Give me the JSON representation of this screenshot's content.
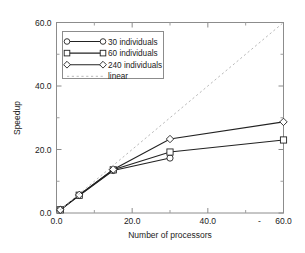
{
  "chart_data": {
    "type": "line",
    "title": "",
    "xlabel": "Number of processors",
    "ylabel": "Speedup",
    "xlim": [
      0,
      60
    ],
    "ylim": [
      0,
      60
    ],
    "grid": false,
    "legend_position": "upper-left-inside",
    "x_ticks": [
      "0.0",
      "20.0",
      "40.0",
      "60.0"
    ],
    "x_tick_values": [
      0,
      20,
      40,
      60
    ],
    "x_minor_ticks": [
      10,
      30,
      50
    ],
    "y_ticks": [
      "0.0",
      "20.0",
      "40.0",
      "60.0"
    ],
    "y_tick_values": [
      0,
      20,
      40,
      60
    ],
    "y_minor_ticks": [
      10,
      30,
      50
    ],
    "series": [
      {
        "name": "30 individuals",
        "marker": "circle",
        "line_style": "solid",
        "color": "#222222",
        "x": [
          1,
          6,
          15,
          30
        ],
        "values": [
          1.0,
          5.5,
          13.4,
          17.3
        ]
      },
      {
        "name": "60 individuals",
        "marker": "square",
        "line_style": "solid",
        "color": "#222222",
        "x": [
          1,
          6,
          15,
          30,
          60
        ],
        "values": [
          1.0,
          5.6,
          13.6,
          19.2,
          23.0
        ]
      },
      {
        "name": "240 individuals",
        "marker": "diamond",
        "line_style": "solid",
        "color": "#222222",
        "x": [
          1,
          6,
          15,
          30,
          60
        ],
        "values": [
          1.0,
          5.7,
          13.7,
          23.3,
          28.7
        ]
      },
      {
        "name": "linear",
        "marker": "none",
        "line_style": "dashed",
        "color": "#b9b9b9",
        "x": [
          0,
          60
        ],
        "values": [
          0,
          60
        ]
      }
    ]
  },
  "legend": {
    "entries": [
      {
        "label": "30 individuals"
      },
      {
        "label": "60 individuals"
      },
      {
        "label": "240 individuals"
      },
      {
        "label": "linear"
      }
    ]
  },
  "axes": {
    "x_title": "Number of processors",
    "y_title": "Speedup",
    "x_tick_labels": [
      "0.0",
      "20.0",
      "40.0",
      "60.0"
    ],
    "y_tick_labels": [
      "0.0",
      "20.0",
      "40.0",
      "60.0"
    ]
  },
  "colors": {
    "data_line": "#222222",
    "reference_line": "#b9b9b9",
    "frame": "#888888",
    "text": "#222222",
    "background": "#ffffff"
  }
}
